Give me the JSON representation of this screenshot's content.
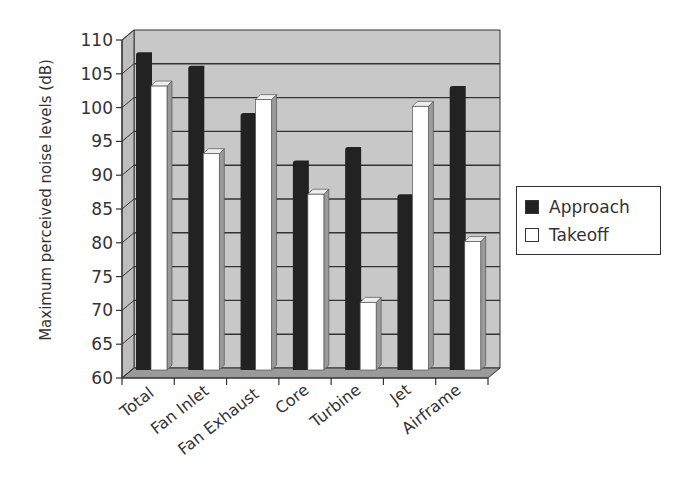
{
  "chart_data": {
    "type": "bar",
    "style": "3d-clustered-column",
    "title": "",
    "xlabel": "",
    "ylabel": "Maximum perceived noise levels (dB)",
    "ylim": [
      60,
      110
    ],
    "yticks": [
      60,
      65,
      70,
      75,
      80,
      85,
      90,
      95,
      100,
      105,
      110
    ],
    "grid": true,
    "legend_position": "right",
    "categories": [
      "Total",
      "Fan Inlet",
      "Fan Exhaust",
      "Core",
      "Turbine",
      "Jet",
      "Airframe"
    ],
    "series": [
      {
        "name": "Approach",
        "color": "#222222",
        "values": [
          107,
          105,
          98,
          91,
          93,
          86,
          102
        ]
      },
      {
        "name": "Takeoff",
        "color": "#ffffff",
        "values": [
          102,
          92,
          100,
          86,
          70,
          99,
          79
        ]
      }
    ]
  },
  "colors": {
    "wall": "#c8c8c8",
    "floor": "#9a9a9a",
    "gridline": "#333333",
    "axis": "#333333",
    "approach": "#222222",
    "takeoff": "#ffffff",
    "takeoff_side": "#9a9a9a"
  },
  "legend": {
    "items": [
      {
        "label": "Approach"
      },
      {
        "label": "Takeoff"
      }
    ]
  }
}
